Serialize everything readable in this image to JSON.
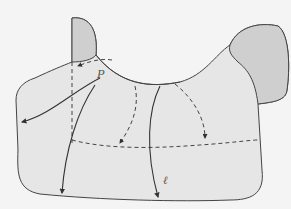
{
  "diagram": {
    "labels": {
      "point": "P",
      "geodesic": "ℓ"
    },
    "colors": {
      "background": "#f4f4f4",
      "surface_light": "#e6e6e6",
      "surface_dark": "#cfcfcf",
      "stroke": "#444444"
    }
  }
}
